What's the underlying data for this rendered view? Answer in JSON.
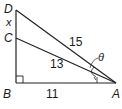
{
  "diagram": {
    "type": "right-triangle-geometry",
    "points": {
      "A": "A",
      "B": "B",
      "C": "C",
      "D": "D"
    },
    "segments": {
      "BA": "11",
      "CA": "13",
      "DA": "15",
      "DC": "x"
    },
    "angle_label": "θ",
    "right_angle_at": "B"
  }
}
